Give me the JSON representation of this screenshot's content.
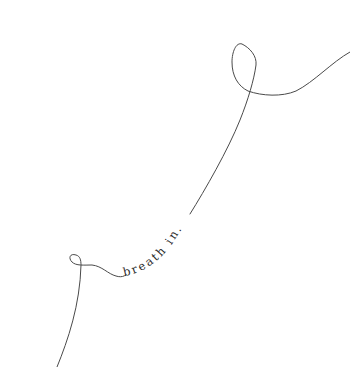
{
  "artwork": {
    "text": "breath in.",
    "stroke_color": "#4a4a4a",
    "text_color": "#2a2a2a",
    "background": "#ffffff"
  }
}
